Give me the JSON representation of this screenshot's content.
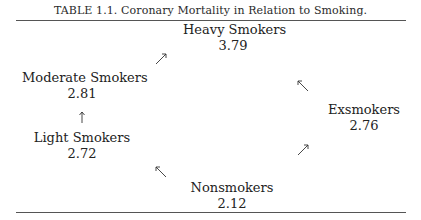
{
  "caption": "TABLE 1.1. Coronary Mortality in Relation to Smoking.",
  "nodes": {
    "heavy": {
      "label": "Heavy Smokers",
      "value": "3.79"
    },
    "moderate": {
      "label": "Moderate Smokers",
      "value": "2.81"
    },
    "light": {
      "label": "Light Smokers",
      "value": "2.72"
    },
    "ex": {
      "label": "Exsmokers",
      "value": "2.76"
    },
    "non": {
      "label": "Nonsmokers",
      "value": "2.12"
    }
  },
  "arrows": [
    {
      "from": "Moderate Smokers",
      "to": "Heavy Smokers",
      "direction": "up-right"
    },
    {
      "from": "Exsmokers",
      "to": "Heavy Smokers",
      "direction": "up-left"
    },
    {
      "from": "Light Smokers",
      "to": "Moderate Smokers",
      "direction": "up"
    },
    {
      "from": "Nonsmokers",
      "to": "Light Smokers",
      "direction": "up-left"
    },
    {
      "from": "Nonsmokers",
      "to": "Exsmokers",
      "direction": "up-right"
    }
  ],
  "colors": {
    "text": "#222222",
    "rule": "#555555",
    "background": "#ffffff"
  }
}
